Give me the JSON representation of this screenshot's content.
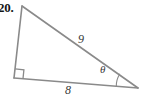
{
  "figure": {
    "problem_number": "20.",
    "background_color": "#ffffff",
    "stroke_color": "#8a8a8a",
    "label_color": "#3a3a3a",
    "shape_name": "right-triangle",
    "labels": {
      "hypotenuse": "9",
      "base": "8",
      "angle": "θ"
    },
    "marks": {
      "right_angle_mark": "right-angle-square",
      "angle_arc": "theta-arc"
    },
    "geometry": {
      "apex": [
        22,
        6
      ],
      "bottom_left": [
        14,
        78
      ],
      "bottom_right": [
        138,
        88
      ],
      "right_angle_vertex": "bottom_left",
      "theta_vertex": "bottom_right"
    }
  }
}
